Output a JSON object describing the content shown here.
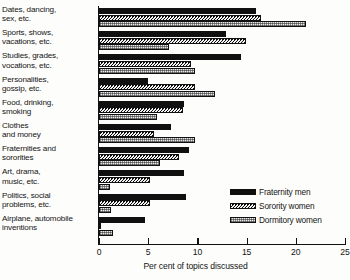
{
  "chart_data": {
    "type": "bar",
    "orientation": "horizontal",
    "title": "",
    "xlabel": "Per cent of topics discussed",
    "ylabel": "",
    "xlim": [
      0,
      25
    ],
    "xticks": [
      0,
      5,
      10,
      15,
      20,
      25
    ],
    "grid": false,
    "legend_position": "lower-right",
    "categories": [
      "Dates, dancing,\nsex, etc.",
      "Sports, shows,\nvacations, etc.",
      "Studies, grades,\nvocations, etc.",
      "Personalities,\ngossip, etc.",
      "Food, drinking,\nsmoking",
      "Clothes\nand money",
      "Fraternities and\nsororities",
      "Art, drama,\nmusic, etc.",
      "Politics, social\nproblems, etc.",
      "Airplane, automobile\ninventions"
    ],
    "series": [
      {
        "name": "Fraternity men",
        "pattern": "solid-black",
        "values": [
          16.0,
          12.9,
          14.4,
          5.0,
          8.6,
          7.3,
          9.1,
          8.6,
          8.8,
          4.7
        ]
      },
      {
        "name": "Sorority women",
        "pattern": "diagonal-hatch",
        "values": [
          16.5,
          14.9,
          9.4,
          9.8,
          8.5,
          5.6,
          8.1,
          5.2,
          5.2,
          0.2
        ]
      },
      {
        "name": "Dormitory women",
        "pattern": "light-speckle",
        "values": [
          21.0,
          7.1,
          9.8,
          11.8,
          5.9,
          9.8,
          6.2,
          1.1,
          1.2,
          1.4
        ]
      }
    ]
  },
  "axis": {
    "tick_labels": [
      "0",
      "5",
      "10",
      "15",
      "20",
      "25"
    ],
    "title": "Per cent of topics discussed"
  },
  "legend": {
    "items": [
      {
        "label": "Fraternity men"
      },
      {
        "label": "Sorority women"
      },
      {
        "label": "Dormitory women"
      }
    ]
  }
}
